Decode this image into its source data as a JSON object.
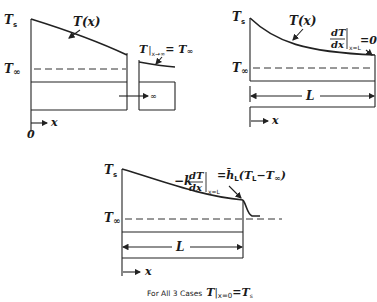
{
  "diagram": {
    "caption": {
      "prefix": "For All 3 Cases",
      "equation_T": "T",
      "equation_sub": "x=0",
      "equation_rhs": "=T",
      "equation_rhs_sub": "s"
    },
    "panels": [
      {
        "id": "case-infinite-fin",
        "labels": {
          "Ts": "T",
          "Ts_sub": "s",
          "Tinf": "T",
          "Tinf_sub": "∞",
          "curve": "T(x)",
          "bc_T": "T",
          "bc_sub": "x→∞",
          "bc_rhs": "= T",
          "bc_rhs_sub": "∞",
          "length": "∞",
          "origin": "0",
          "x_axis": "x"
        }
      },
      {
        "id": "case-adiabatic-tip",
        "labels": {
          "Ts": "T",
          "Ts_sub": "s",
          "Tinf": "T",
          "Tinf_sub": "∞",
          "curve": "T(x)",
          "bc_num": "dT",
          "bc_den": "dx",
          "bc_sub": "x=L",
          "bc_rhs": "=0",
          "length": "L",
          "x_axis": "x"
        }
      },
      {
        "id": "case-convective-tip",
        "labels": {
          "Ts": "T",
          "Ts_sub": "s",
          "Tinf": "T",
          "Tinf_sub": "∞",
          "bc_lhs": "−k",
          "bc_num": "dT",
          "bc_den": "dx",
          "bc_sub": "x=L",
          "bc_rhs": "=h̄",
          "bc_rhs_sub": "L",
          "bc_rhs_tail": "(T",
          "bc_rhs_tail_sub": "L",
          "bc_rhs_tail2": "−T",
          "bc_rhs_tail2_sub": "∞",
          "bc_close": ")",
          "length": "L",
          "x_axis": "x"
        }
      }
    ]
  }
}
